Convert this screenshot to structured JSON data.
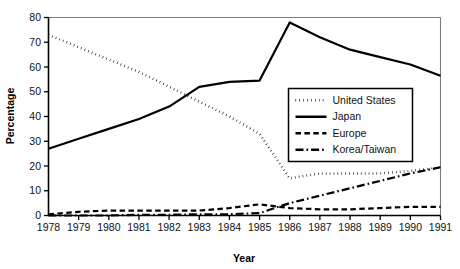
{
  "chart_data": {
    "type": "line",
    "title": "",
    "xlabel": "Year",
    "ylabel": "Percentage",
    "categories": [
      "1978",
      "1979",
      "1980",
      "1981",
      "1982",
      "1983",
      "1984",
      "1985",
      "1986",
      "1987",
      "1988",
      "1989",
      "1990",
      "1991"
    ],
    "x": [
      1978,
      1979,
      1980,
      1981,
      1982,
      1983,
      1984,
      1985,
      1986,
      1987,
      1988,
      1989,
      1990,
      1991
    ],
    "xlim": [
      1978,
      1991
    ],
    "ylim": [
      0,
      80
    ],
    "yticks": [
      0,
      10,
      20,
      30,
      40,
      50,
      60,
      70,
      80
    ],
    "ytick_labels": [
      "0",
      "10",
      "20",
      "30",
      "40",
      "50",
      "60",
      "70",
      "80"
    ],
    "grid": false,
    "legend_position": "center-right",
    "series": [
      {
        "name": "United States",
        "style": "dotted",
        "values": [
          73,
          68,
          63,
          58,
          52,
          46,
          40,
          33,
          15,
          17,
          17,
          17,
          18,
          19.5
        ]
      },
      {
        "name": "Japan",
        "style": "solid",
        "values": [
          27,
          31,
          35,
          39,
          44,
          52,
          54,
          54.5,
          78,
          72,
          67,
          64,
          61,
          56.5
        ]
      },
      {
        "name": "Europe",
        "style": "dashed",
        "values": [
          0.5,
          1.5,
          2,
          2,
          2,
          2,
          3,
          4.5,
          3,
          2.5,
          2.5,
          3,
          3.5,
          3.5
        ]
      },
      {
        "name": "Korea/Taiwan",
        "style": "dashdot",
        "values": [
          0,
          0,
          0,
          0.3,
          0.3,
          0.5,
          0.5,
          1,
          5,
          8,
          11,
          14,
          17,
          19.5
        ]
      }
    ]
  },
  "legend": {
    "items": [
      {
        "label": "United States",
        "style": "dotted"
      },
      {
        "label": "Japan",
        "style": "solid"
      },
      {
        "label": "Europe",
        "style": "dashed"
      },
      {
        "label": "Korea/Taiwan",
        "style": "dashdot"
      }
    ]
  },
  "colors": {
    "ink": "#000000",
    "frame": "#7d7d7d",
    "background": "#ffffff"
  }
}
